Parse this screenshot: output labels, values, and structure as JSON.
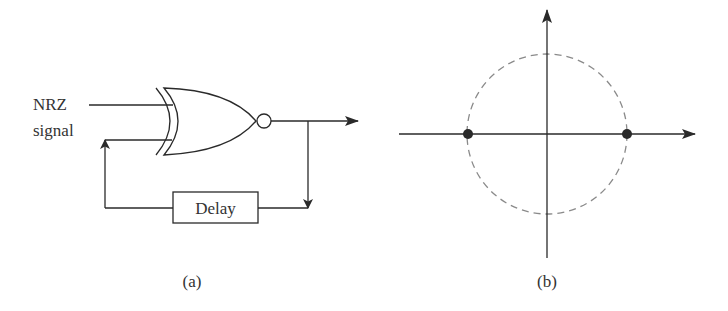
{
  "panel_a": {
    "input_label_line1": "NRZ",
    "input_label_line2": "signal",
    "gate_type": "XNOR",
    "delay_label": "Delay",
    "caption": "(a)"
  },
  "panel_b": {
    "caption": "(b)",
    "constellation_points": [
      {
        "x": -1,
        "y": 0
      },
      {
        "x": 1,
        "y": 0
      }
    ],
    "reference_circle": "dashed unit circle"
  },
  "colors": {
    "line": "#2a2a2a",
    "text": "#333333",
    "dashed_circle": "#8a8a8a",
    "background": "#ffffff"
  }
}
